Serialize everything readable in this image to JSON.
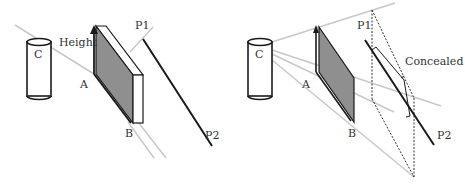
{
  "colors": {
    "background": "#ffffff",
    "ink": "#1a1a1a",
    "sight_line": "#c8c8c8",
    "panel_fill": "#8f8f8f",
    "label": "#333333"
  },
  "left_panel": {
    "camera_label": "C",
    "height_label": "Height",
    "point_a_label": "A",
    "point_b_label": "B",
    "p1_label": "P1",
    "p2_label": "P2"
  },
  "right_panel": {
    "camera_label": "C",
    "point_a_label": "A",
    "point_b_label": "B",
    "p1_label": "P1",
    "p2_label": "P2",
    "concealed_label": "Concealed"
  }
}
